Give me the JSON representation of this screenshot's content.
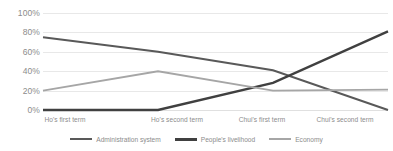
{
  "chart_data": {
    "type": "line",
    "title": "",
    "xlabel": "",
    "ylabel": "",
    "categories": [
      "Ho's first term",
      "Ho's second term",
      "Chui's first term",
      "Chui's second term"
    ],
    "series": [
      {
        "name": "Administration system",
        "values": [
          75,
          60,
          41,
          0
        ],
        "color": "#595959"
      },
      {
        "name": "People's livelihood",
        "values": [
          0,
          0,
          28,
          81
        ],
        "color": "#404040"
      },
      {
        "name": "Economy",
        "values": [
          20,
          40,
          20,
          21
        ],
        "color": "#a6a6a6"
      }
    ],
    "ylim": [
      0,
      100
    ],
    "y_ticks": [
      "0%",
      "20%",
      "40%",
      "60%",
      "80%",
      "100%"
    ],
    "y_tick_values": [
      0,
      20,
      40,
      60,
      80,
      100
    ],
    "grid": true,
    "legend_position": "bottom",
    "value_format": "percent"
  },
  "legend": {
    "items": [
      {
        "label": "Administration system",
        "color": "#595959"
      },
      {
        "label": "People's livelihood",
        "color": "#404040"
      },
      {
        "label": "Economy",
        "color": "#a6a6a6"
      }
    ]
  },
  "axis": {
    "y_labels": [
      "100%",
      "80%",
      "60%",
      "40%",
      "20%",
      "0%"
    ],
    "x_labels": [
      "Ho's first term",
      "Ho's second term",
      "Chui's first term",
      "Chui's second term"
    ]
  }
}
